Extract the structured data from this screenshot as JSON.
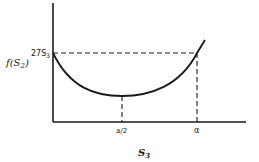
{
  "diagram": {
    "y_axis_label": "f(S",
    "y_axis_label_sub": "2",
    "y_axis_label_close": ")",
    "y_tick_label": "27S",
    "y_tick_sub": "3",
    "x_tick_mid": "a/2",
    "x_tick_end": "α",
    "x_axis_label": "S",
    "x_axis_sub": "3",
    "colors": {
      "stroke": "#1a1a1a",
      "background": "#ffffff"
    }
  }
}
